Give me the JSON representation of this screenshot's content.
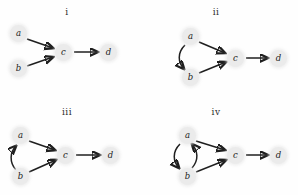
{
  "figure": {
    "background_color": "#fefefe",
    "node_color": "#ebebeb",
    "edge_color": "#1f1f1f",
    "label_color": "#222222"
  },
  "panels": [
    {
      "id": "panel-i",
      "label": "i",
      "label_pos": {
        "x": 52,
        "y": 7
      },
      "nodes": [
        {
          "id": "a",
          "label": "a",
          "x": 18,
          "y": 33
        },
        {
          "id": "b",
          "label": "b",
          "x": 18,
          "y": 68
        },
        {
          "id": "c",
          "label": "c",
          "x": 63,
          "y": 52
        },
        {
          "id": "d",
          "label": "d",
          "x": 108,
          "y": 52
        }
      ],
      "edges": [
        {
          "from": "a",
          "to": "c",
          "kind": "straight"
        },
        {
          "from": "b",
          "to": "c",
          "kind": "straight"
        },
        {
          "from": "c",
          "to": "d",
          "kind": "straight"
        }
      ]
    },
    {
      "id": "panel-ii",
      "label": "ii",
      "label_pos": {
        "x": 52,
        "y": 7
      },
      "nodes": [
        {
          "id": "a",
          "label": "a",
          "x": 41,
          "y": 36
        },
        {
          "id": "b",
          "label": "b",
          "x": 41,
          "y": 77
        },
        {
          "id": "c",
          "label": "c",
          "x": 86,
          "y": 58
        },
        {
          "id": "d",
          "label": "d",
          "x": 129,
          "y": 58
        }
      ],
      "edges": [
        {
          "from": "a",
          "to": "c",
          "kind": "straight"
        },
        {
          "from": "b",
          "to": "c",
          "kind": "straight"
        },
        {
          "from": "c",
          "to": "d",
          "kind": "straight"
        },
        {
          "from": "a",
          "to": "b",
          "kind": "curved-left"
        }
      ]
    },
    {
      "id": "panel-iii",
      "label": "iii",
      "label_pos": {
        "x": 52,
        "y": 9
      },
      "nodes": [
        {
          "id": "a",
          "label": "a",
          "x": 20,
          "y": 37
        },
        {
          "id": "b",
          "label": "b",
          "x": 20,
          "y": 78
        },
        {
          "id": "c",
          "label": "c",
          "x": 65,
          "y": 57
        },
        {
          "id": "d",
          "label": "d",
          "x": 110,
          "y": 57
        }
      ],
      "edges": [
        {
          "from": "a",
          "to": "c",
          "kind": "straight"
        },
        {
          "from": "b",
          "to": "c",
          "kind": "straight"
        },
        {
          "from": "c",
          "to": "d",
          "kind": "straight"
        },
        {
          "from": "b",
          "to": "a",
          "kind": "curved-left"
        }
      ]
    },
    {
      "id": "panel-iv",
      "label": "iv",
      "label_pos": {
        "x": 52,
        "y": 9
      },
      "nodes": [
        {
          "id": "a",
          "label": "a",
          "x": 38,
          "y": 37
        },
        {
          "id": "b",
          "label": "b",
          "x": 38,
          "y": 78
        },
        {
          "id": "c",
          "label": "c",
          "x": 86,
          "y": 57
        },
        {
          "id": "d",
          "label": "d",
          "x": 129,
          "y": 57
        }
      ],
      "edges": [
        {
          "from": "a",
          "to": "c",
          "kind": "straight"
        },
        {
          "from": "b",
          "to": "c",
          "kind": "straight"
        },
        {
          "from": "c",
          "to": "d",
          "kind": "straight"
        },
        {
          "from": "a",
          "to": "b",
          "kind": "curved-left"
        },
        {
          "from": "b",
          "to": "a",
          "kind": "curved-right"
        }
      ]
    }
  ]
}
